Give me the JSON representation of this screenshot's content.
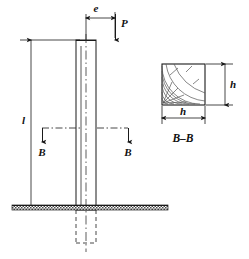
{
  "figure": {
    "labels": {
      "load": "P",
      "eccentricity": "e",
      "length": "l",
      "section_left": "B",
      "section_right": "B",
      "section_caption": "B–B",
      "section_width": "h",
      "section_height": "h"
    },
    "colors": {
      "line": "#1a1a1a",
      "grain": "#555555",
      "ground": "#6b6b6b",
      "background": "#ffffff"
    },
    "elements": {
      "column_label": "vertical column",
      "ground_label": "ground line",
      "buried_label": "buried column portion",
      "cross_section_label": "square timber cross section",
      "grain_label": "annual growth rings"
    }
  }
}
